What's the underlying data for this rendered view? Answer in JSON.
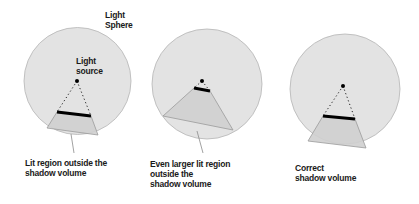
{
  "colors": {
    "sphere_fill": "#e3e3e3",
    "sphere_stroke": "#b5b5b5",
    "volume_fill": "#cfcfcf",
    "volume_stroke": "#9a9a9a",
    "occluder": "#000000",
    "light": "#000000",
    "leader": "#8a8a8a",
    "text": "#1a1a1a"
  },
  "labels": {
    "light_sphere": [
      "Light",
      "Sphere"
    ],
    "light_source": [
      "Light",
      "source"
    ]
  },
  "panels": [
    {
      "id": "panel-1",
      "caption": [
        "Lit region outside the",
        "shadow volume"
      ],
      "sphere": {
        "cx": 77.5,
        "cy": 81,
        "r": 53.5
      },
      "light": {
        "x": 77,
        "y": 81
      },
      "occluder": [
        [
          57,
          112
        ],
        [
          91,
          116
        ]
      ],
      "volume": [
        [
          57,
          112
        ],
        [
          91,
          116
        ],
        [
          98,
          135
        ],
        [
          47,
          128
        ]
      ],
      "leader": [
        [
          71,
          134
        ],
        [
          74,
          153
        ]
      ]
    },
    {
      "id": "panel-2",
      "caption": [
        "Even larger lit region",
        "outside the",
        "shadow volume"
      ],
      "sphere": {
        "cx": 207,
        "cy": 84,
        "r": 55
      },
      "light": {
        "x": 202,
        "y": 81
      },
      "occluder": [
        [
          194,
          88
        ],
        [
          210,
          91
        ]
      ],
      "volume": [
        [
          194,
          88
        ],
        [
          210,
          91
        ],
        [
          233,
          130
        ],
        [
          163,
          116
        ]
      ],
      "leader": [
        [
          197,
          131
        ],
        [
          203,
          153
        ]
      ]
    },
    {
      "id": "panel-3",
      "caption": [
        "Correct",
        "shadow volume"
      ],
      "sphere": {
        "cx": 345,
        "cy": 89,
        "r": 55
      },
      "light": {
        "x": 343,
        "y": 86
      },
      "occluder": [
        [
          323,
          116
        ],
        [
          355,
          119
        ]
      ],
      "volume": [
        [
          323,
          116
        ],
        [
          355,
          119
        ],
        [
          366,
          148
        ],
        [
          308,
          141
        ]
      ],
      "leader": null
    }
  ]
}
